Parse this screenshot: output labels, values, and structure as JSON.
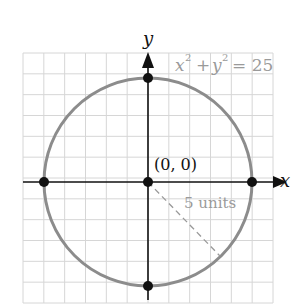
{
  "chart_data": {
    "type": "scatter",
    "title": "",
    "equation": "x² + y² = 25",
    "xlabel": "x",
    "ylabel": "y",
    "xlim": [
      -6,
      6
    ],
    "ylim": [
      -6,
      6
    ],
    "grid": true,
    "curve": {
      "type": "circle",
      "center": [
        0,
        0
      ],
      "radius": 5
    },
    "points": [
      {
        "x": 0,
        "y": 0,
        "label": "(0, 0)"
      },
      {
        "x": 5,
        "y": 0
      },
      {
        "x": -5,
        "y": 0
      },
      {
        "x": 0,
        "y": 5
      },
      {
        "x": 0,
        "y": -5
      }
    ],
    "annotations": [
      {
        "text": "5 units",
        "type": "radius-dashed-line"
      }
    ]
  },
  "labels": {
    "x_axis": "x",
    "y_axis": "y",
    "equation_x": "x",
    "equation_plus": "+",
    "equation_y": "y",
    "equation_exp": "2",
    "equation_rhs": "= 25",
    "origin": "(0, 0)",
    "radius": "5 units"
  },
  "colors": {
    "grid": "#d4d4d4",
    "circle": "#8a8a8a",
    "axis": "#111111",
    "label_gray": "#9a9a9a"
  }
}
